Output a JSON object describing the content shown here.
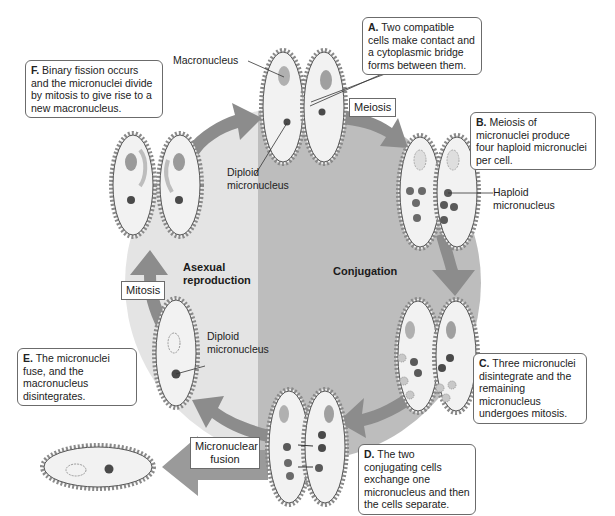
{
  "figure": {
    "topic": "Paramecium life cycle: asexual reproduction and conjugation",
    "colors": {
      "background": "#ffffff",
      "asexual_region": "#e2e2e2",
      "conjugation_region": "#bdbdbd",
      "arrow": "#8c8c8c",
      "cell_fill": "#f2f2f2",
      "cell_outline": "#555555",
      "cilia": "#7a7a7a",
      "macronucleus": "#a8a8a8",
      "micronucleus": "#5a5a5a",
      "oral_groove": "#d0d0d0"
    }
  },
  "regions": {
    "asexual": "Asexual reproduction",
    "asexual_line1": "Asexual",
    "asexual_line2": "reproduction",
    "conjugation": "Conjugation"
  },
  "steps": [
    {
      "letter": "A.",
      "text": " Two compatible cells make contact and a cytoplasmic bridge forms between them."
    },
    {
      "letter": "B.",
      "text": " Meiosis of micronuclei produce four haploid micronuclei per cell."
    },
    {
      "letter": "C.",
      "text": " Three micronuclei disintegrate and the remaining micronucleus undergoes mitosis."
    },
    {
      "letter": "D.",
      "text": " The two conjugating cells exchange one micronucleus and then the cells separate."
    },
    {
      "letter": "E.",
      "text": " The micronuclei fuse, and the macronucleus disintegrates."
    },
    {
      "letter": "F.",
      "text": " Binary fission occurs and the micronuclei divide by mitosis to give rise to a new macronucleus."
    }
  ],
  "process_tags": {
    "meiosis": "Meiosis",
    "mitosis": "Mitosis",
    "micronuclear_fusion_line1": "Micronuclear",
    "micronuclear_fusion_line2": "fusion"
  },
  "structure_labels": {
    "macronucleus": "Macronucleus",
    "diploid_micronucleus_top_1": "Diploid",
    "diploid_micronucleus_top_2": "micronucleus",
    "haploid_micronucleus_1": "Haploid",
    "haploid_micronucleus_2": "micronucleus",
    "diploid_micronucleus_left_1": "Diploid",
    "diploid_micronucleus_left_2": "micronucleus"
  }
}
